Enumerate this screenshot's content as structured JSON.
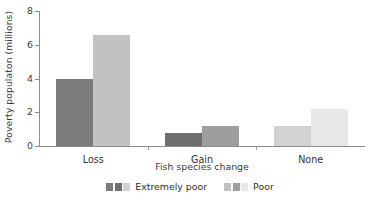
{
  "chart_data": {
    "type": "bar",
    "title": "",
    "subtitle": "",
    "xlabel": "Fish species change",
    "ylabel": "Poverty populaton (millions)",
    "categories": [
      "Loss",
      "Gain",
      "None"
    ],
    "series": [
      {
        "name": "Extremely poor",
        "values": [
          4.0,
          0.75,
          1.2
        ],
        "colors": [
          "#7b7b7b",
          "#6e6e6e",
          "#d2d2d2"
        ]
      },
      {
        "name": "Poor",
        "values": [
          6.6,
          1.2,
          2.2
        ],
        "colors": [
          "#c2c2c2",
          "#9e9e9e",
          "#e7e7e7"
        ]
      }
    ],
    "ylim": [
      0,
      8
    ],
    "yticks": [
      0,
      2,
      4,
      6,
      8
    ],
    "ytick_labels": [
      "0",
      "2",
      "4",
      "6",
      "8"
    ],
    "grid": false,
    "legend_position": "bottom",
    "annotations": []
  },
  "legend": {
    "entries": [
      {
        "label": "Extremely poor",
        "swatches": [
          "#7b7b7b",
          "#6e6e6e",
          "#d2d2d2"
        ]
      },
      {
        "label": "Poor",
        "swatches": [
          "#c2c2c2",
          "#9e9e9e",
          "#e7e7e7"
        ]
      }
    ]
  },
  "axes": {
    "y_title": "Poverty populaton (millions)",
    "x_title": "Fish species change",
    "y_tick_labels": [
      "0",
      "2",
      "4",
      "6",
      "8"
    ],
    "x_tick_labels": [
      "Loss",
      "Gain",
      "None"
    ]
  },
  "colors": {
    "axis": "#8d8d8d",
    "text": "#2b2b2b",
    "background": "#ffffff"
  }
}
